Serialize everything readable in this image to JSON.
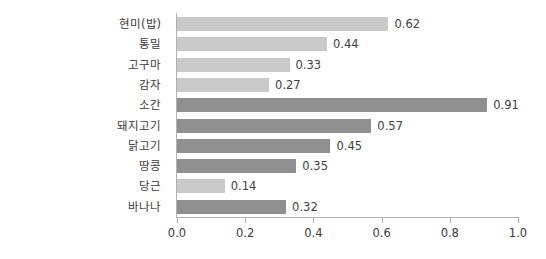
{
  "chart_data": {
    "type": "bar",
    "orientation": "horizontal",
    "title": "",
    "xlabel": "",
    "ylabel": "",
    "xlim": [
      0.0,
      1.0
    ],
    "xticks": [
      "0.0",
      "0.2",
      "0.4",
      "0.6",
      "0.8",
      "1.0"
    ],
    "xtick_values": [
      0.0,
      0.2,
      0.4,
      0.6,
      0.8,
      1.0
    ],
    "grid": false,
    "legend": "none",
    "categories": [
      "현미(밥)",
      "통밀",
      "고구마",
      "감자",
      "소간",
      "돼지고기",
      "닭고기",
      "땅콩",
      "당근",
      "바나나"
    ],
    "values": [
      0.62,
      0.44,
      0.33,
      0.27,
      0.91,
      0.57,
      0.45,
      0.35,
      0.14,
      0.32
    ],
    "value_labels": [
      "0.62",
      "0.44",
      "0.33",
      "0.27",
      "0.91",
      "0.57",
      "0.45",
      "0.35",
      "0.14",
      "0.32"
    ],
    "bar_shades": [
      "light",
      "light",
      "light",
      "light",
      "dark",
      "dark",
      "dark",
      "dark",
      "light",
      "dark"
    ],
    "bars": [
      {
        "category": "현미(밥)",
        "value": 0.62,
        "label": "0.62",
        "shade": "light"
      },
      {
        "category": "통밀",
        "value": 0.44,
        "label": "0.44",
        "shade": "light"
      },
      {
        "category": "고구마",
        "value": 0.33,
        "label": "0.33",
        "shade": "light"
      },
      {
        "category": "감자",
        "value": 0.27,
        "label": "0.27",
        "shade": "light"
      },
      {
        "category": "소간",
        "value": 0.91,
        "label": "0.91",
        "shade": "dark"
      },
      {
        "category": "돼지고기",
        "value": 0.57,
        "label": "0.57",
        "shade": "dark"
      },
      {
        "category": "닭고기",
        "value": 0.45,
        "label": "0.45",
        "shade": "dark"
      },
      {
        "category": "땅콩",
        "value": 0.35,
        "label": "0.35",
        "shade": "dark"
      },
      {
        "category": "당근",
        "value": 0.14,
        "label": "0.14",
        "shade": "light"
      },
      {
        "category": "바나나",
        "value": 0.32,
        "label": "0.32",
        "shade": "dark"
      }
    ]
  },
  "colors": {
    "bar_light": "#c9c9c9",
    "bar_dark": "#8f8f8f",
    "axis": "#b0b0b0",
    "text": "#3a3a3a",
    "value_text": "#404040",
    "background": "#ffffff"
  }
}
